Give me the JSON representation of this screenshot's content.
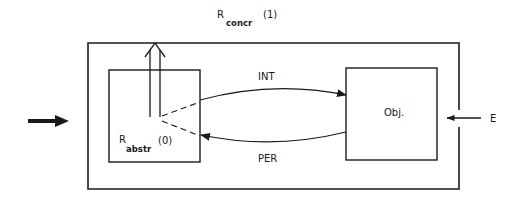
{
  "title": {
    "symbol": "R",
    "subscript": "concr",
    "index": "(1)"
  },
  "inner_system": {
    "symbol": "R",
    "subscript": "abstr",
    "index": "(0)"
  },
  "object_box": {
    "label": "Obj."
  },
  "arcs": {
    "top_label": "INT",
    "bottom_label": "PER"
  },
  "external": {
    "label": "E"
  },
  "colors": {
    "stroke": "#1a1a1a",
    "background": "#ffffff"
  }
}
